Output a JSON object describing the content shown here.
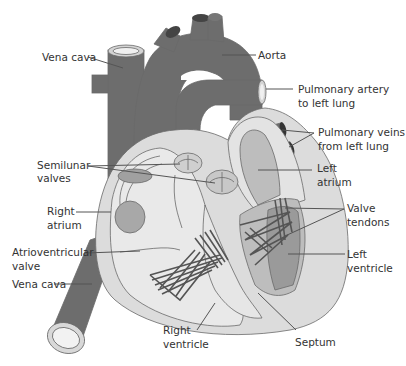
{
  "diagram": {
    "colors": {
      "vessel_dark": "#6d6d6d",
      "vessel_rim": "#d4d4d4",
      "heart_outer": "#dcdcdc",
      "chamber_light": "#e9e9e9",
      "chamber_mid": "#bdbdbd",
      "left_dark": "#9a9a9a",
      "tendon": "#555555",
      "label_text": "#333333",
      "background": "#ffffff"
    },
    "labels": {
      "vena_cava_top": "Vena cava",
      "aorta": "Aorta",
      "pulmonary_artery_line1": "Pulmonary artery",
      "pulmonary_artery_line2": "to left lung",
      "pulmonary_veins_line1": "Pulmonary veins",
      "pulmonary_veins_line2": "from left lung",
      "semilunar_line1": "Semilunar",
      "semilunar_line2": "valves",
      "left_atrium_line1": "Left",
      "left_atrium_line2": "atrium",
      "right_atrium_line1": "Right",
      "right_atrium_line2": "atrium",
      "valve_tendons_line1": "Valve",
      "valve_tendons_line2": "tendons",
      "atrioventricular_line1": "Atrioventricular",
      "atrioventricular_line2": "valve",
      "left_ventricle_line1": "Left",
      "left_ventricle_line2": "ventricle",
      "vena_cava_bottom": "Vena cava",
      "right_ventricle_line1": "Right",
      "right_ventricle_line2": "ventricle",
      "septum": "Septum"
    }
  }
}
